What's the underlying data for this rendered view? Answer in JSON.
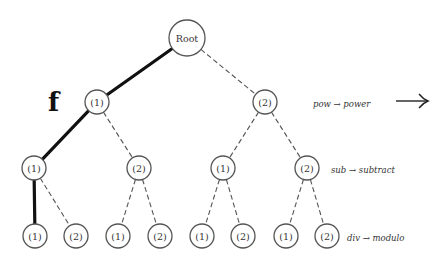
{
  "diagram": {
    "function_label": "f",
    "big_arrow": "⟶",
    "root": {
      "id": "root",
      "label": "Root",
      "x": 187,
      "y": 38,
      "r": 18
    },
    "levels": [
      {
        "annotation": "pow → power",
        "annotation_x": 313,
        "annotation_y": 104,
        "nodes": [
          {
            "id": "l1-1",
            "label": "(1)",
            "x": 97,
            "y": 102,
            "parent": "root",
            "edge": "solid"
          },
          {
            "id": "l1-2",
            "label": "(2)",
            "x": 265,
            "y": 102,
            "parent": "root",
            "edge": "dashed"
          }
        ]
      },
      {
        "annotation": "sub → subtract",
        "annotation_x": 331,
        "annotation_y": 170,
        "nodes": [
          {
            "id": "l2-1",
            "label": "(1)",
            "x": 34,
            "y": 168,
            "parent": "l1-1",
            "edge": "solid"
          },
          {
            "id": "l2-2",
            "label": "(2)",
            "x": 139,
            "y": 168,
            "parent": "l1-1",
            "edge": "dashed"
          },
          {
            "id": "l2-3",
            "label": "(1)",
            "x": 223,
            "y": 168,
            "parent": "l1-2",
            "edge": "dashed"
          },
          {
            "id": "l2-4",
            "label": "(2)",
            "x": 307,
            "y": 168,
            "parent": "l1-2",
            "edge": "dashed"
          }
        ]
      },
      {
        "annotation": "div → modulo",
        "annotation_x": 347,
        "annotation_y": 238,
        "nodes": [
          {
            "id": "l3-1",
            "label": "(1)",
            "x": 35,
            "y": 236,
            "parent": "l2-1",
            "edge": "solid"
          },
          {
            "id": "l3-2",
            "label": "(2)",
            "x": 76,
            "y": 236,
            "parent": "l2-1",
            "edge": "dashed"
          },
          {
            "id": "l3-3",
            "label": "(1)",
            "x": 118,
            "y": 236,
            "parent": "l2-2",
            "edge": "dashed"
          },
          {
            "id": "l3-4",
            "label": "(2)",
            "x": 160,
            "y": 236,
            "parent": "l2-2",
            "edge": "dashed"
          },
          {
            "id": "l3-5",
            "label": "(1)",
            "x": 202,
            "y": 236,
            "parent": "l2-3",
            "edge": "dashed"
          },
          {
            "id": "l3-6",
            "label": "(2)",
            "x": 243,
            "y": 236,
            "parent": "l2-3",
            "edge": "dashed"
          },
          {
            "id": "l3-7",
            "label": "(1)",
            "x": 286,
            "y": 236,
            "parent": "l2-4",
            "edge": "dashed"
          },
          {
            "id": "l3-8",
            "label": "(2)",
            "x": 327,
            "y": 236,
            "parent": "l2-4",
            "edge": "dashed"
          }
        ]
      }
    ],
    "node_radius": 12
  }
}
